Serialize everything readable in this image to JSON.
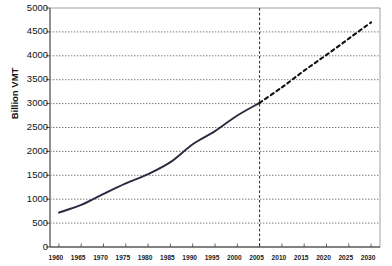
{
  "chart_data": {
    "type": "line",
    "title": "",
    "xlabel": "",
    "ylabel": "Billion VMT",
    "xlim": [
      1958,
      2032
    ],
    "ylim": [
      0,
      5000
    ],
    "grid": true,
    "legend": "none",
    "y_ticks": [
      0,
      500,
      1000,
      1500,
      2000,
      2500,
      3000,
      3500,
      4000,
      4500,
      5000
    ],
    "y_tick_labels": [
      "0",
      "500",
      "1000",
      "1500",
      "2000",
      "2500",
      "3000",
      "3500",
      "4000",
      "4500",
      "5000"
    ],
    "x_ticks": [
      1960,
      1965,
      1970,
      1975,
      1980,
      1985,
      1990,
      1995,
      2000,
      2005,
      2010,
      2015,
      2020,
      2025,
      2030
    ],
    "x_tick_labels": [
      "1960",
      "1965",
      "1970",
      "1975",
      "1980",
      "1985",
      "1990",
      "1995",
      "2000",
      "2005",
      "2010",
      "2015",
      "2020",
      "2025",
      "2030"
    ],
    "annotations": [
      {
        "name": "forecast-divider",
        "type": "vline",
        "x": 2005,
        "style": "dashed"
      }
    ],
    "series": [
      {
        "name": "Historical VMT",
        "style": "solid",
        "color": "#2a2a40",
        "x": [
          1960,
          1965,
          1970,
          1975,
          1980,
          1985,
          1990,
          1995,
          2000,
          2005
        ],
        "values": [
          720,
          880,
          1110,
          1330,
          1525,
          1775,
          2150,
          2425,
          2750,
          3015
        ]
      },
      {
        "name": "Projected VMT",
        "style": "dashed",
        "color": "#111111",
        "x": [
          2005,
          2010,
          2015,
          2020,
          2025,
          2030
        ],
        "values": [
          3015,
          3340,
          3690,
          4020,
          4360,
          4700
        ]
      }
    ]
  },
  "axes": {
    "y_title": "Billion VMT"
  }
}
